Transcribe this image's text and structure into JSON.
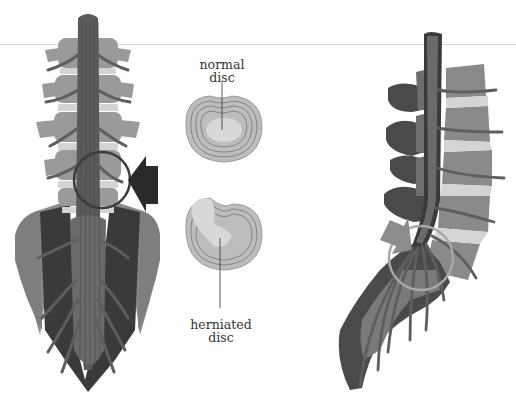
{
  "diagram": {
    "panels": [
      {
        "id": "posterior-view",
        "description": "spine posterior view with sacrum, highlighted circle and arrow"
      },
      {
        "id": "disc-comparison",
        "description": "cross sections of normal and herniated intervertebral disc"
      },
      {
        "id": "lateral-view",
        "description": "spine lateral view with highlighted circle and arrow"
      }
    ],
    "labels": {
      "normal_disc_line1": "normal",
      "normal_disc_line2": "disc",
      "herniated_disc_line1": "herniated",
      "herniated_disc_line2": "disc"
    },
    "colors": {
      "background": "#ffffff",
      "spinal_cord": "#5a5a5a",
      "vertebra_light": "#9a9a9a",
      "vertebra_dark": "#3a3a3a",
      "disc": "#d4d4d4",
      "nerve": "#6e6e6e",
      "highlight_circle_left": "#3c3c3c",
      "highlight_circle_right": "#a8a8a8",
      "arrow_left": "#2a2a2a",
      "arrow_right": "#8c8c8c",
      "disc_section": "#bdbdbd"
    }
  }
}
